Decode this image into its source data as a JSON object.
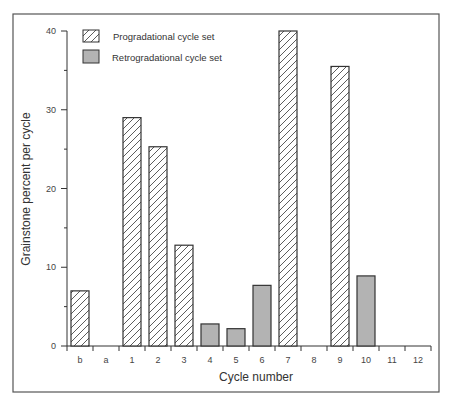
{
  "chart_data": {
    "type": "bar",
    "title": "",
    "xlabel": "Cycle number",
    "ylabel": "Grainstone percent per cycle",
    "ylim": [
      0,
      40
    ],
    "yticks_labeled": [
      0,
      10,
      20,
      30,
      40
    ],
    "yticks_minor": [
      5,
      15,
      25,
      35
    ],
    "grid": false,
    "legend_position": "upper-left",
    "categories": [
      "b",
      "a",
      "1",
      "2",
      "3",
      "4",
      "5",
      "6",
      "7",
      "8",
      "9",
      "10",
      "11",
      "12"
    ],
    "series": [
      {
        "name": "Progradational cycle set",
        "fill": "hatched",
        "values": [
          7,
          null,
          29,
          25.3,
          12.8,
          null,
          null,
          null,
          40,
          null,
          35.5,
          null,
          null,
          null
        ]
      },
      {
        "name": "Retrogradational cycle set",
        "fill": "#b3b3b3",
        "values": [
          null,
          null,
          null,
          null,
          null,
          2.8,
          2.2,
          7.7,
          null,
          null,
          null,
          8.9,
          null,
          null
        ]
      }
    ]
  },
  "legend": {
    "items": [
      {
        "label": "Progradational cycle set",
        "style": "hatched"
      },
      {
        "label": "Retrogradational cycle set",
        "style": "gray"
      }
    ]
  },
  "axes": {
    "x_title": "Cycle number",
    "y_title": "Grainstone percent per cycle",
    "y_tick_labels": [
      "0",
      "10",
      "20",
      "30",
      "40"
    ],
    "x_tick_labels": [
      "b",
      "a",
      "1",
      "2",
      "3",
      "4",
      "5",
      "6",
      "7",
      "8",
      "9",
      "10",
      "11",
      "12"
    ]
  },
  "colors": {
    "frame": "#555555",
    "bar_outline": "#333333",
    "retro_fill": "#b3b3b3",
    "hatch": "#333333"
  }
}
